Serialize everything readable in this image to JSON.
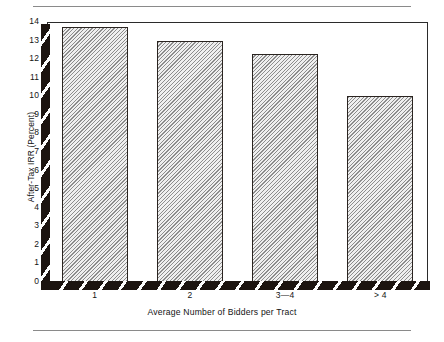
{
  "chart_data": {
    "type": "bar",
    "title": "",
    "subtitle": "",
    "xlabel": "Average Number of Bidders per Tract",
    "ylabel": "After-Tax IRR (Percent)",
    "categories": [
      "1",
      "2",
      "3—4",
      "> 4"
    ],
    "values": [
      13.75,
      13.0,
      12.3,
      10.0
    ],
    "series": [
      {
        "name": "After-Tax IRR (Percent)",
        "values": [
          13.75,
          13.0,
          12.3,
          10.0
        ]
      }
    ],
    "ylim": [
      0,
      14
    ],
    "xlim": null,
    "ytick_labels": [
      "0",
      "1",
      "2",
      "3",
      "4",
      "5",
      "6",
      "7",
      "8",
      "9",
      "10",
      "11",
      "12",
      "13",
      "14"
    ],
    "ytick_values": [
      0,
      1,
      2,
      3,
      4,
      5,
      6,
      7,
      8,
      9,
      10,
      11,
      12,
      13,
      14
    ],
    "xtick_labels": [
      "1",
      "2",
      "3—4",
      "> 4"
    ],
    "grid": false,
    "legend": null,
    "legend_position": "none",
    "annotations": [],
    "bar_fill": "#efefef",
    "bar_fill_pattern": "diagonal-hatch",
    "bar_edge_color": "#2a2420",
    "axis_band_color": "#1c1410",
    "frame_color": "#2b2b2b",
    "rule_color": "#8a8a8a",
    "background": "#ffffff"
  },
  "figure": {
    "top_rule": "",
    "bottom_rule": ""
  }
}
